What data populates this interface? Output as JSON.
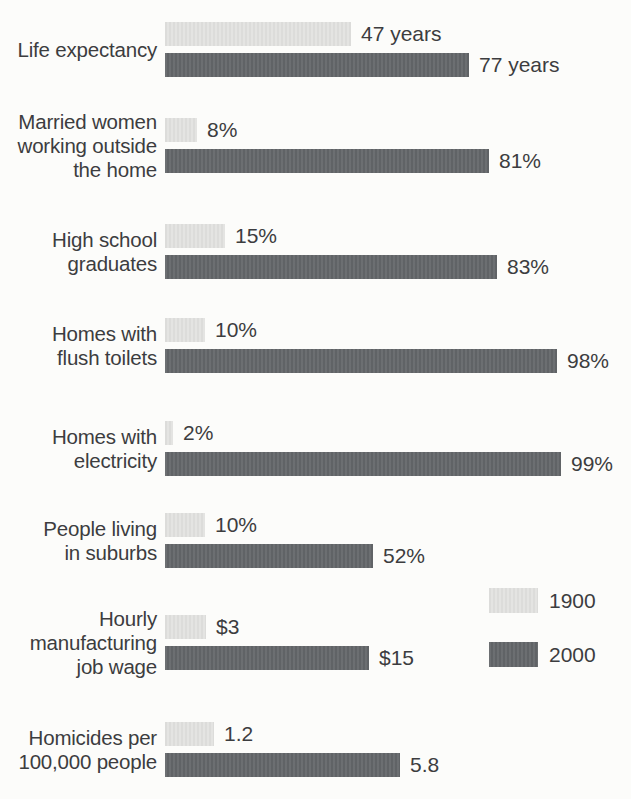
{
  "page": {
    "background": "#fcfcfa",
    "text_color": "#3c3d3f"
  },
  "chart_data": {
    "type": "bar",
    "orientation": "horizontal",
    "title": "",
    "grid": false,
    "legend_position": "middle-right",
    "legend": {
      "entries": [
        {
          "label": "1900",
          "color": "#e4e4e2"
        },
        {
          "label": "2000",
          "color": "#64676a"
        }
      ]
    },
    "categories": [
      "Life expectancy",
      "Married women working outside the home",
      "High school graduates",
      "Homes with flush toilets",
      "Homes with electricity",
      "People living in suburbs",
      "Hourly manufacturing job wage",
      "Homicides per 100,000 people"
    ],
    "series": [
      {
        "name": "1900",
        "values": [
          47,
          8,
          15,
          10,
          2,
          10,
          3,
          1.2
        ]
      },
      {
        "name": "2000",
        "values": [
          77,
          81,
          83,
          98,
          99,
          52,
          15,
          5.8
        ]
      }
    ],
    "rows": [
      {
        "label": "Life expectancy",
        "value_1900": 47,
        "value_2000": 77,
        "display_1900": "47 years",
        "display_2000": "77 years",
        "px_per_unit": 3.95,
        "top": 22
      },
      {
        "label": "Married women\nworking outside\nthe home",
        "value_1900": 8,
        "value_2000": 81,
        "display_1900": "8%",
        "display_2000": "81%",
        "px_per_unit": 4.0,
        "top": 118
      },
      {
        "label": "High school\ngraduates",
        "value_1900": 15,
        "value_2000": 83,
        "display_1900": "15%",
        "display_2000": "83%",
        "px_per_unit": 4.0,
        "top": 224
      },
      {
        "label": "Homes with\nflush toilets",
        "value_1900": 10,
        "value_2000": 98,
        "display_1900": "10%",
        "display_2000": "98%",
        "px_per_unit": 4.0,
        "top": 318
      },
      {
        "label": "Homes with\nelectricity",
        "value_1900": 2,
        "value_2000": 99,
        "display_1900": "2%",
        "display_2000": "99%",
        "px_per_unit": 4.0,
        "top": 421
      },
      {
        "label": "People living\nin suburbs",
        "value_1900": 10,
        "value_2000": 52,
        "display_1900": "10%",
        "display_2000": "52%",
        "px_per_unit": 4.0,
        "top": 513
      },
      {
        "label": "Hourly\nmanufacturing\njob wage",
        "value_1900": 3,
        "value_2000": 15,
        "display_1900": "$3",
        "display_2000": "$15",
        "px_per_unit": 13.6,
        "top": 615
      },
      {
        "label": "Homicides per\n100,000 people",
        "value_1900": 1.2,
        "value_2000": 5.8,
        "display_1900": "1.2",
        "display_2000": "5.8",
        "px_per_unit": 40.5,
        "top": 722
      }
    ]
  }
}
